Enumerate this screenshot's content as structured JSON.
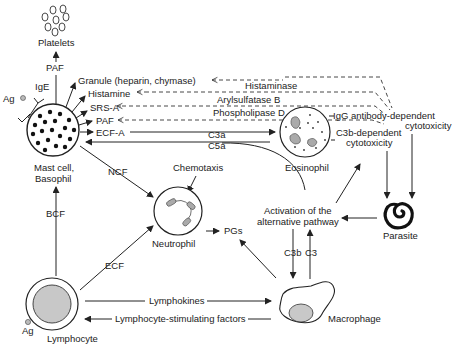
{
  "diagram": {
    "nodes": {
      "platelets": "Platelets",
      "mast_cell_line1": "Mast cell,",
      "mast_cell_line2": "Basophil",
      "eosinophil": "Eosinophil",
      "neutrophil": "Neutrophil",
      "lymphocyte": "Lymphocyte",
      "macrophage": "Macrophage",
      "parasite": "Parasite",
      "alt_pathway_line1": "Activation of the",
      "alt_pathway_line2": "alternative pathway",
      "pgs": "PGs"
    },
    "mast_products": [
      "Granule (heparin, chymase)",
      "Histamine",
      "SRS-A",
      "PAF",
      "ECF-A"
    ],
    "eosinophil_enzymes": [
      "Histaminase",
      "Arylsulfatase B",
      "Phospholipase D"
    ],
    "labels": {
      "paf_platelets": "PAF",
      "ige": "IgE",
      "ag_top": "Ag",
      "ag_bottom": "Ag",
      "c3a": "C3a",
      "c5a": "C5a",
      "chemotaxis": "Chemotaxis",
      "ncf": "NCF",
      "bcf": "BCF",
      "ecf": "ECF",
      "c3b": "C3b",
      "c3": "C3",
      "lymphokines": "Lymphokines",
      "lymphocyte_stim": "Lymphocyte-stimulating factors",
      "igg_line1": "IgG antibody-dependent",
      "igg_line2": "cytotoxicity",
      "c3b_dep_line1": "C3b-dependent",
      "c3b_dep_line2": "cytotoxicity"
    }
  }
}
